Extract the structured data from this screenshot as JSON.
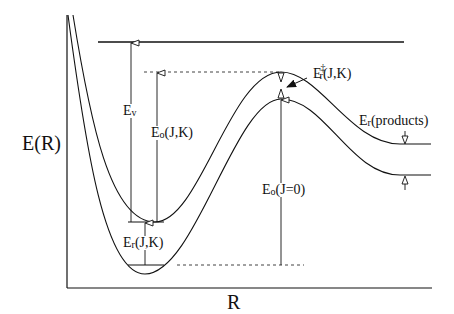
{
  "diagram": {
    "type": "potential-energy-curve",
    "axes": {
      "y_label": "E(R)",
      "x_label": "R"
    },
    "curves": [
      {
        "name": "upper-effective-potential",
        "description": "rotating (J,K) potential"
      },
      {
        "name": "lower-potential",
        "description": "J=0 potential"
      }
    ],
    "labels": {
      "ev": {
        "main": "E",
        "sub": "v",
        "rest": ""
      },
      "eo_jk": {
        "main": "E",
        "sub": "o",
        "rest": "(J,K)"
      },
      "er_jk": {
        "main": "E",
        "sub": "r",
        "rest": "(J,K)"
      },
      "eo_j0": {
        "main": "E",
        "sub": "o",
        "rest": "(J=0)"
      },
      "er_ts": {
        "main": "E",
        "sup": "‡",
        "sub": "r",
        "rest": "(J,K)"
      },
      "er_products": {
        "main": "E",
        "sub": "r",
        "rest": "(products)"
      }
    },
    "colors": {
      "line": "#111111",
      "background": "#ffffff"
    }
  }
}
